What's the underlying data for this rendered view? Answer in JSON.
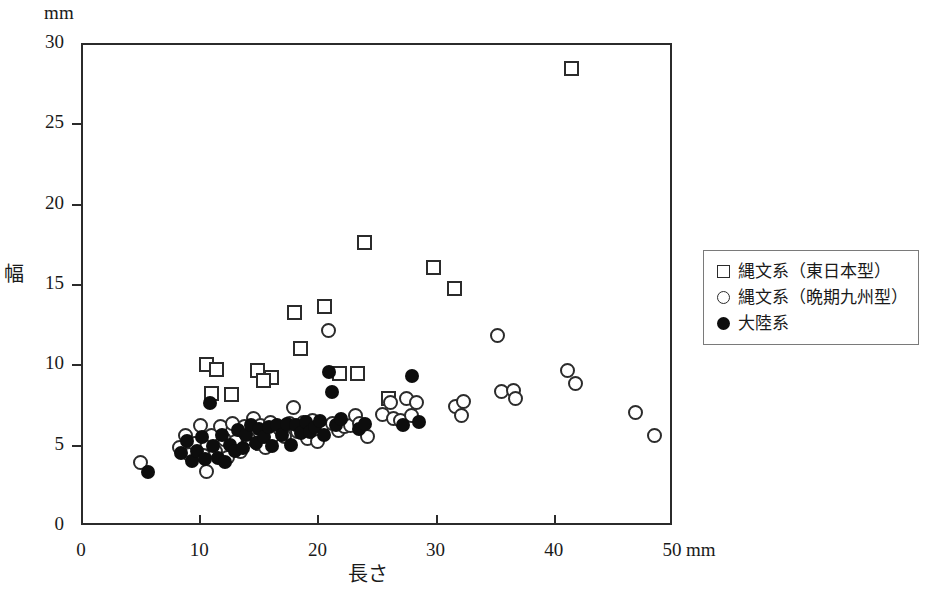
{
  "chart_data": {
    "type": "scatter",
    "title": "",
    "xlabel": "長さ",
    "ylabel": "幅",
    "x_unit": "mm",
    "y_unit": "mm",
    "xlim": [
      0,
      50
    ],
    "ylim": [
      0,
      30
    ],
    "xticks": [
      0,
      10,
      20,
      30,
      40,
      50
    ],
    "yticks": [
      0,
      5,
      10,
      15,
      20,
      25,
      30
    ],
    "xtick_labels": [
      "0",
      "10",
      "20",
      "30",
      "40",
      "50"
    ],
    "ytick_labels": [
      "0",
      "5",
      "10",
      "15",
      "20",
      "25",
      "30"
    ],
    "grid": false,
    "legend_position": "right",
    "series": [
      {
        "name": "縄文系（東日本型）",
        "marker": "open-square",
        "color": "#2b2b2b",
        "points": [
          [
            41.5,
            28.4
          ],
          [
            24.0,
            17.6
          ],
          [
            29.8,
            16.0
          ],
          [
            31.6,
            14.7
          ],
          [
            18.1,
            13.2
          ],
          [
            20.6,
            13.6
          ],
          [
            18.6,
            11.0
          ],
          [
            10.6,
            10.0
          ],
          [
            11.5,
            9.7
          ],
          [
            14.9,
            9.6
          ],
          [
            16.1,
            9.2
          ],
          [
            15.4,
            9.0
          ],
          [
            23.4,
            9.4
          ],
          [
            11.0,
            8.2
          ],
          [
            12.7,
            8.1
          ],
          [
            21.9,
            9.4
          ],
          [
            26.0,
            7.9
          ]
        ]
      },
      {
        "name": "縄文系（晩期九州型）",
        "marker": "open-circle",
        "color": "#2b2b2b",
        "points": [
          [
            5.0,
            3.9
          ],
          [
            8.3,
            4.8
          ],
          [
            8.8,
            5.6
          ],
          [
            9.2,
            4.4
          ],
          [
            9.6,
            5.1
          ],
          [
            10.1,
            6.2
          ],
          [
            10.4,
            4.3
          ],
          [
            10.6,
            3.3
          ],
          [
            11.0,
            5.6
          ],
          [
            11.4,
            4.6
          ],
          [
            11.8,
            6.1
          ],
          [
            12.1,
            5.3
          ],
          [
            12.4,
            4.2
          ],
          [
            12.8,
            6.3
          ],
          [
            13.1,
            5.2
          ],
          [
            13.5,
            4.6
          ],
          [
            13.8,
            6.1
          ],
          [
            14.2,
            5.4
          ],
          [
            14.6,
            6.6
          ],
          [
            14.9,
            5.1
          ],
          [
            15.2,
            6.2
          ],
          [
            15.6,
            4.8
          ],
          [
            16.0,
            6.4
          ],
          [
            16.3,
            5.6
          ],
          [
            16.8,
            6.0
          ],
          [
            17.2,
            5.5
          ],
          [
            17.6,
            6.3
          ],
          [
            18.0,
            7.3
          ],
          [
            18.3,
            5.8
          ],
          [
            18.8,
            6.4
          ],
          [
            19.2,
            5.4
          ],
          [
            19.6,
            6.5
          ],
          [
            20.0,
            5.2
          ],
          [
            20.4,
            6.2
          ],
          [
            20.9,
            12.1
          ],
          [
            21.3,
            6.3
          ],
          [
            21.8,
            5.9
          ],
          [
            22.3,
            6.1
          ],
          [
            22.8,
            6.2
          ],
          [
            23.2,
            6.8
          ],
          [
            23.6,
            6.3
          ],
          [
            24.2,
            5.5
          ],
          [
            25.5,
            6.9
          ],
          [
            26.2,
            7.6
          ],
          [
            26.4,
            6.6
          ],
          [
            27.0,
            6.5
          ],
          [
            27.5,
            7.9
          ],
          [
            28.0,
            6.8
          ],
          [
            28.4,
            7.6
          ],
          [
            31.7,
            7.4
          ],
          [
            32.2,
            6.8
          ],
          [
            32.4,
            7.7
          ],
          [
            35.2,
            11.8
          ],
          [
            35.6,
            8.3
          ],
          [
            36.6,
            8.4
          ],
          [
            36.8,
            7.9
          ],
          [
            41.2,
            9.6
          ],
          [
            41.8,
            8.8
          ],
          [
            46.9,
            7.0
          ],
          [
            48.5,
            5.6
          ]
        ]
      },
      {
        "name": "大陸系",
        "marker": "filled-circle",
        "color": "#0d0d0d",
        "points": [
          [
            5.7,
            3.3
          ],
          [
            8.5,
            4.5
          ],
          [
            9.0,
            5.2
          ],
          [
            9.4,
            4.0
          ],
          [
            9.8,
            4.6
          ],
          [
            10.2,
            5.5
          ],
          [
            10.5,
            4.1
          ],
          [
            10.9,
            7.6
          ],
          [
            11.2,
            4.9
          ],
          [
            11.6,
            4.2
          ],
          [
            11.9,
            5.6
          ],
          [
            12.2,
            3.9
          ],
          [
            12.6,
            5.0
          ],
          [
            13.0,
            4.6
          ],
          [
            13.3,
            5.9
          ],
          [
            13.7,
            4.8
          ],
          [
            14.0,
            5.6
          ],
          [
            14.4,
            6.2
          ],
          [
            14.8,
            5.1
          ],
          [
            15.1,
            6.0
          ],
          [
            15.5,
            5.5
          ],
          [
            15.9,
            6.1
          ],
          [
            16.2,
            4.9
          ],
          [
            16.6,
            6.2
          ],
          [
            17.0,
            5.6
          ],
          [
            17.4,
            6.3
          ],
          [
            17.8,
            5.0
          ],
          [
            18.2,
            6.2
          ],
          [
            18.6,
            5.7
          ],
          [
            19.0,
            6.4
          ],
          [
            19.4,
            5.8
          ],
          [
            19.8,
            6.1
          ],
          [
            20.2,
            6.5
          ],
          [
            20.6,
            5.6
          ],
          [
            21.0,
            9.5
          ],
          [
            21.2,
            8.3
          ],
          [
            21.6,
            6.2
          ],
          [
            22.0,
            6.6
          ],
          [
            23.5,
            6.0
          ],
          [
            24.0,
            6.3
          ],
          [
            27.2,
            6.2
          ],
          [
            28.0,
            9.3
          ],
          [
            28.6,
            6.4
          ]
        ]
      }
    ]
  },
  "axes": {
    "top_unit": "mm",
    "x_end_unit": "mm"
  },
  "legend": {
    "items": [
      {
        "marker": "open-square",
        "label": "縄文系（東日本型）"
      },
      {
        "marker": "open-circle",
        "label": "縄文系（晩期九州型）"
      },
      {
        "marker": "filled-circle",
        "label": "大陸系"
      }
    ]
  }
}
